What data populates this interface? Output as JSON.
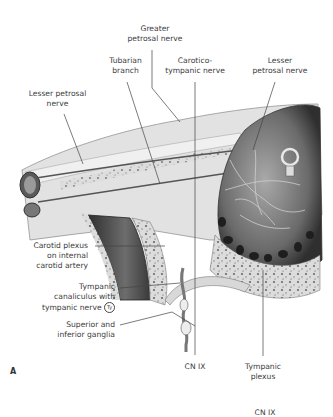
{
  "figure": {
    "panel_label": "A",
    "labels": {
      "greater_petrosal_nerve": [
        "Greater",
        "petrosal nerve"
      ],
      "tubarian_branch": [
        "Tubarian",
        "branch"
      ],
      "caroticotympanic_nerve": [
        "Carotico-",
        "tympanic nerve"
      ],
      "lesser_petrosal_nerve_right": [
        "Lesser",
        "petrosal nerve"
      ],
      "lesser_petrosal_nerve_left": [
        "Lesser petrosal",
        "nerve"
      ],
      "carotid_plexus": [
        "Carotid plexus",
        "on internal",
        "carotid artery"
      ],
      "tympanic_canaliculus": [
        "Tympanic",
        "canaliculus with",
        "tympanic nerve"
      ],
      "tympanic_nerve_badge": "Ty",
      "superior_inferior_ganglia": [
        "Superior and",
        "inferior ganglia"
      ],
      "cn_ix": "CN IX",
      "tympanic_plexus": [
        "Tympanic",
        "plexus"
      ],
      "cn_ix_bottom": "CN IX"
    },
    "colors": {
      "bone_light": "#e6e6e6",
      "bone_dark": "#3a3a3a",
      "leader_line": "#444444"
    }
  }
}
